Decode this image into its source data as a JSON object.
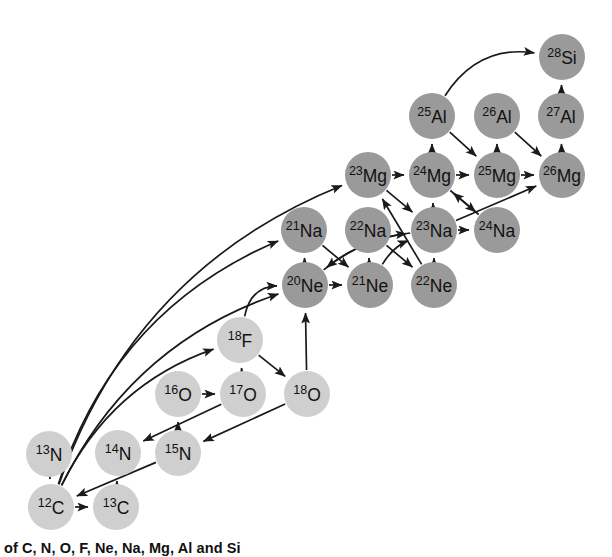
{
  "figure": {
    "kind": "nuclear-reaction-network-diagram",
    "caption": "of C, N, O, F, Ne, Na, Mg, Al and Si",
    "canvas": {
      "width": 612,
      "height": 557
    },
    "node_radius": 23,
    "colors": {
      "light_nuclide_fill": "#cfcfcf",
      "heavy_nuclide_fill": "#9a9a9a",
      "arrow_stroke": "#1a1a1a",
      "label_text": "#111111",
      "background": "#ffffff"
    },
    "legend_note": "Light grey circles: C, N, O, F. Dark grey circles: Ne, Na, Mg, Al, Si."
  },
  "nodes": [
    {
      "id": "C12",
      "mass": "12",
      "symbol": "C",
      "x": 51,
      "y": 507,
      "shade": "light"
    },
    {
      "id": "C13",
      "mass": "13",
      "symbol": "C",
      "x": 116,
      "y": 507,
      "shade": "light"
    },
    {
      "id": "N13",
      "mass": "13",
      "symbol": "N",
      "x": 49,
      "y": 454,
      "shade": "light"
    },
    {
      "id": "N14",
      "mass": "14",
      "symbol": "N",
      "x": 118,
      "y": 453,
      "shade": "light"
    },
    {
      "id": "N15",
      "mass": "15",
      "symbol": "N",
      "x": 178,
      "y": 453,
      "shade": "light"
    },
    {
      "id": "O16",
      "mass": "16",
      "symbol": "O",
      "x": 178,
      "y": 394,
      "shade": "light"
    },
    {
      "id": "O17",
      "mass": "17",
      "symbol": "O",
      "x": 243,
      "y": 394,
      "shade": "light"
    },
    {
      "id": "O18",
      "mass": "18",
      "symbol": "O",
      "x": 307,
      "y": 394,
      "shade": "light"
    },
    {
      "id": "F18",
      "mass": "18",
      "symbol": "F",
      "x": 240,
      "y": 340,
      "shade": "light"
    },
    {
      "id": "Ne20",
      "mass": "20",
      "symbol": "Ne",
      "x": 305,
      "y": 285,
      "shade": "dark"
    },
    {
      "id": "Ne21",
      "mass": "21",
      "symbol": "Ne",
      "x": 370,
      "y": 285,
      "shade": "dark"
    },
    {
      "id": "Ne22",
      "mass": "22",
      "symbol": "Ne",
      "x": 434,
      "y": 285,
      "shade": "dark"
    },
    {
      "id": "Na21",
      "mass": "21",
      "symbol": "Na",
      "x": 304,
      "y": 230,
      "shade": "dark"
    },
    {
      "id": "Na22",
      "mass": "22",
      "symbol": "Na",
      "x": 368,
      "y": 230,
      "shade": "dark"
    },
    {
      "id": "Na23",
      "mass": "23",
      "symbol": "Na",
      "x": 434,
      "y": 230,
      "shade": "dark"
    },
    {
      "id": "Na24",
      "mass": "24",
      "symbol": "Na",
      "x": 497,
      "y": 230,
      "shade": "dark"
    },
    {
      "id": "Mg23",
      "mass": "23",
      "symbol": "Mg",
      "x": 368,
      "y": 175,
      "shade": "dark"
    },
    {
      "id": "Mg24",
      "mass": "24",
      "symbol": "Mg",
      "x": 432,
      "y": 175,
      "shade": "dark"
    },
    {
      "id": "Mg25",
      "mass": "25",
      "symbol": "Mg",
      "x": 497,
      "y": 175,
      "shade": "dark"
    },
    {
      "id": "Mg26",
      "mass": "26",
      "symbol": "Mg",
      "x": 562,
      "y": 175,
      "shade": "dark"
    },
    {
      "id": "Al25",
      "mass": "25",
      "symbol": "Al",
      "x": 432,
      "y": 116,
      "shade": "dark"
    },
    {
      "id": "Al26",
      "mass": "26",
      "symbol": "Al",
      "x": 497,
      "y": 116,
      "shade": "dark"
    },
    {
      "id": "Al27",
      "mass": "27",
      "symbol": "Al",
      "x": 561,
      "y": 116,
      "shade": "dark"
    },
    {
      "id": "Si28",
      "mass": "28",
      "symbol": "Si",
      "x": 562,
      "y": 57,
      "shade": "dark"
    }
  ],
  "edges": [
    {
      "from": "C12",
      "to": "C13",
      "style": "straight"
    },
    {
      "from": "C13",
      "to": "N14",
      "style": "straight"
    },
    {
      "from": "N13",
      "to": "C12",
      "style": "straight"
    },
    {
      "from": "N14",
      "to": "N15",
      "style": "hidden"
    },
    {
      "from": "N15",
      "to": "C12",
      "style": "straight"
    },
    {
      "from": "N15",
      "to": "O16",
      "style": "straight"
    },
    {
      "from": "O16",
      "to": "O17",
      "style": "straight"
    },
    {
      "from": "O17",
      "to": "N14",
      "style": "straight"
    },
    {
      "from": "O17",
      "to": "F18",
      "style": "straight"
    },
    {
      "from": "F18",
      "to": "O18",
      "style": "straight"
    },
    {
      "from": "O18",
      "to": "N15",
      "style": "straight"
    },
    {
      "from": "O18",
      "to": "Ne20",
      "style": "straight"
    },
    {
      "from": "F18",
      "to": "Ne20",
      "style": "arc",
      "bow": -34
    },
    {
      "from": "C12",
      "to": "F18",
      "style": "arc",
      "bow": -52
    },
    {
      "from": "C12",
      "to": "Ne20",
      "style": "arc",
      "bow": -70
    },
    {
      "from": "C12",
      "to": "Na21",
      "style": "arc",
      "bow": -86
    },
    {
      "from": "C12",
      "to": "Mg23",
      "style": "arc",
      "bow": -104
    },
    {
      "from": "Ne20",
      "to": "Ne21",
      "style": "straight"
    },
    {
      "from": "Ne20",
      "to": "Na21",
      "style": "straight"
    },
    {
      "from": "Ne21",
      "to": "Na22",
      "style": "straight"
    },
    {
      "from": "Ne22",
      "to": "Na23",
      "style": "straight"
    },
    {
      "from": "Na21",
      "to": "Ne21",
      "style": "cross"
    },
    {
      "from": "Na22",
      "to": "Ne22",
      "style": "cross"
    },
    {
      "from": "Ne20",
      "to": "Na23",
      "style": "arc",
      "bow": -20
    },
    {
      "from": "Ne21",
      "to": "Na23",
      "style": "arc",
      "bow": -14
    },
    {
      "from": "Ne22",
      "to": "Mg23",
      "style": "cross"
    },
    {
      "from": "Na23",
      "to": "Ne20",
      "style": "arc",
      "bow": 20
    },
    {
      "from": "Na23",
      "to": "Na24",
      "style": "straight"
    },
    {
      "from": "Na23",
      "to": "Mg24",
      "style": "straight"
    },
    {
      "from": "Na24",
      "to": "Mg24",
      "style": "cross"
    },
    {
      "from": "Na23",
      "to": "Mg26",
      "style": "cross"
    },
    {
      "from": "Mg23",
      "to": "Na23",
      "style": "straight"
    },
    {
      "from": "Mg23",
      "to": "Mg24",
      "style": "straight"
    },
    {
      "from": "Mg24",
      "to": "Mg25",
      "style": "straight"
    },
    {
      "from": "Mg25",
      "to": "Mg26",
      "style": "straight"
    },
    {
      "from": "Mg24",
      "to": "Al25",
      "style": "straight"
    },
    {
      "from": "Mg25",
      "to": "Al26",
      "style": "straight"
    },
    {
      "from": "Mg26",
      "to": "Al27",
      "style": "straight"
    },
    {
      "from": "Al25",
      "to": "Mg25",
      "style": "cross"
    },
    {
      "from": "Al26",
      "to": "Mg26",
      "style": "cross"
    },
    {
      "from": "Al27",
      "to": "Si28",
      "style": "straight"
    },
    {
      "from": "Al25",
      "to": "Si28",
      "style": "arc",
      "bow": -46
    },
    {
      "from": "Mg24",
      "to": "Na24",
      "style": "cross"
    }
  ]
}
